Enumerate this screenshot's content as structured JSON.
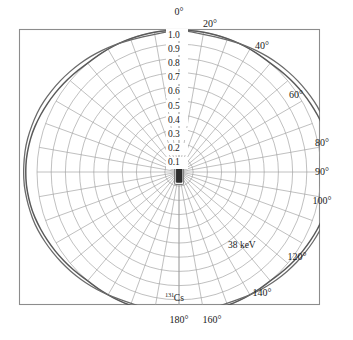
{
  "figure": {
    "name": "polar-anisotropy-plot",
    "kind": "polar-plot",
    "background": "#ffffff",
    "frame": {
      "x": 19,
      "y": 29,
      "width": 301,
      "height": 276,
      "stroke": "#8a8a8a"
    },
    "center": {
      "x": 179,
      "y": 172
    },
    "unit_radius_px": 142
  },
  "chart_data": {
    "type": "line",
    "subtype": "polar",
    "title": "",
    "subtitle": "",
    "xlabel": "",
    "ylabel": "",
    "polar": true,
    "theta_units": "degrees",
    "theta_zero_location": "N",
    "theta_direction": "clockwise",
    "theta_range": [
      0,
      180
    ],
    "theta_tick_step": 10,
    "r_range": [
      0,
      1.0
    ],
    "r_ticks": [
      0.1,
      0.2,
      0.3,
      0.4,
      0.5,
      0.6,
      0.7,
      0.8,
      0.9,
      1.0
    ],
    "r_tick_labels": [
      "0.1",
      "0.2",
      "0.3",
      "0.4",
      "0.5",
      "0.6",
      "0.7",
      "0.8",
      "0.9",
      "1.0"
    ],
    "grid": true,
    "grid_circles": 10,
    "grid_spoke_step_deg": 10,
    "legend_position": "inline-annotation",
    "angle_tick_labels": [
      "0°",
      "20°",
      "40°",
      "60°",
      "80°",
      "90°",
      "100°",
      "120°",
      "140°",
      "160°",
      "180°"
    ],
    "annotations": [
      {
        "text": "38 keV",
        "theta_deg": 133,
        "r": 0.8
      },
      {
        "text": "131Cs",
        "html": "<sup>131</sup>Cs",
        "theta_deg": 177,
        "r": 0.8
      }
    ],
    "series": [
      {
        "name": "38 keV",
        "color": "#5a5a5a",
        "theta": [
          0,
          5,
          10,
          15,
          20,
          25,
          30,
          35,
          40,
          45,
          50,
          55,
          60,
          65,
          70,
          75,
          80,
          85,
          90,
          95,
          100,
          105,
          110,
          115,
          120,
          125,
          130,
          135,
          140,
          145,
          150,
          155,
          160,
          165,
          170,
          175,
          180
        ],
        "values": [
          1.0,
          1.0,
          1.0,
          1.0,
          1.0,
          1.0,
          1.0,
          1.0,
          1.0,
          1.01,
          1.02,
          1.03,
          1.04,
          1.05,
          1.06,
          1.07,
          1.075,
          1.08,
          1.08,
          1.08,
          1.075,
          1.07,
          1.06,
          1.05,
          1.04,
          1.03,
          1.02,
          1.01,
          1.0,
          1.0,
          1.0,
          1.0,
          1.0,
          1.0,
          1.0,
          1.0,
          1.0
        ]
      },
      {
        "name": "131Cs",
        "color": "#6a6a6a",
        "theta": [
          0,
          5,
          10,
          15,
          20,
          25,
          30,
          35,
          40,
          45,
          50,
          55,
          60,
          65,
          70,
          75,
          80,
          85,
          90,
          95,
          100,
          105,
          110,
          115,
          120,
          125,
          130,
          135,
          140,
          145,
          150,
          155,
          160,
          165,
          170,
          175,
          180
        ],
        "values": [
          1.0,
          0.99,
          0.985,
          0.985,
          0.99,
          1.0,
          1.01,
          1.02,
          1.03,
          1.04,
          1.05,
          1.06,
          1.07,
          1.08,
          1.085,
          1.09,
          1.095,
          1.095,
          1.095,
          1.095,
          1.09,
          1.085,
          1.08,
          1.07,
          1.06,
          1.05,
          1.04,
          1.03,
          1.02,
          1.01,
          1.0,
          0.99,
          0.985,
          0.985,
          0.99,
          1.0,
          1.0
        ]
      }
    ]
  },
  "radial_axis": {
    "name": "radial-axis",
    "labels": [
      {
        "text": "1.0",
        "r": 1.0
      },
      {
        "text": "0.9",
        "r": 0.9
      },
      {
        "text": "0.8",
        "r": 0.8
      },
      {
        "text": "0.7",
        "r": 0.7
      },
      {
        "text": "0.6",
        "r": 0.6
      },
      {
        "text": "0.5",
        "r": 0.5
      },
      {
        "text": "0.4",
        "r": 0.4
      },
      {
        "text": "0.3",
        "r": 0.3
      },
      {
        "text": "0.2",
        "r": 0.2
      },
      {
        "text": "0.1",
        "r": 0.1
      }
    ]
  },
  "angular_axis": {
    "name": "angular-axis",
    "labels": [
      {
        "text": "0°",
        "deg": 0,
        "x": 179,
        "y": 12
      },
      {
        "text": "20°",
        "deg": 20,
        "x": 210,
        "y": 24
      },
      {
        "text": "40°",
        "deg": 40,
        "x": 262,
        "y": 46
      },
      {
        "text": "60°",
        "deg": 60,
        "x": 296,
        "y": 95
      },
      {
        "text": "80°",
        "deg": 80,
        "x": 322,
        "y": 143
      },
      {
        "text": "90°",
        "deg": 90,
        "x": 322,
        "y": 172
      },
      {
        "text": "100°",
        "deg": 100,
        "x": 322,
        "y": 201
      },
      {
        "text": "120°",
        "deg": 120,
        "x": 297,
        "y": 257
      },
      {
        "text": "140°",
        "deg": 140,
        "x": 262,
        "y": 293
      },
      {
        "text": "160°",
        "deg": 160,
        "x": 212,
        "y": 320
      },
      {
        "text": "180°",
        "deg": 180,
        "x": 179,
        "y": 320
      }
    ]
  },
  "source_icon": {
    "name": "brachytherapy-seed-icon",
    "description": "sealed source capsule at polar origin",
    "x": 179,
    "y": 172,
    "width": 9,
    "height": 26
  },
  "curve_annotation_energy": {
    "text": "38 keV",
    "x": 228,
    "y": 241
  },
  "curve_annotation_isotope": {
    "mass_number": "131",
    "element": "Cs",
    "x": 165,
    "y": 292
  }
}
